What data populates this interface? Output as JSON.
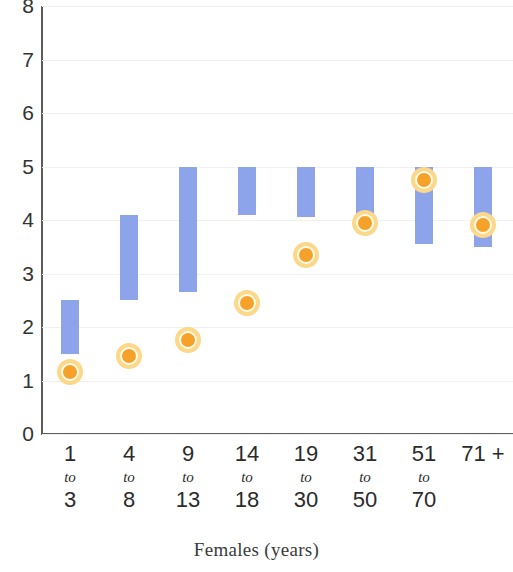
{
  "chart_data": {
    "type": "bar",
    "title": "",
    "subtitle": "",
    "xlabel": "Females (years)",
    "ylabel": "",
    "ylim": [
      0,
      8
    ],
    "y_ticks": [
      0,
      1,
      2,
      3,
      4,
      5,
      6,
      7,
      8
    ],
    "grid": true,
    "legend": "none",
    "categories": [
      "1 to 3",
      "4 to 8",
      "9 to 13",
      "14 to 18",
      "19 to 30",
      "31 to 50",
      "51 to 70",
      "71 +"
    ],
    "category_lines": [
      {
        "first": "1",
        "to": "to",
        "second": "3"
      },
      {
        "first": "4",
        "to": "to",
        "second": "8"
      },
      {
        "first": "9",
        "to": "to",
        "second": "13"
      },
      {
        "first": "14",
        "to": "to",
        "second": "18"
      },
      {
        "first": "19",
        "to": "to",
        "second": "30"
      },
      {
        "first": "31",
        "to": "to",
        "second": "50"
      },
      {
        "first": "51",
        "to": "to",
        "second": "70"
      },
      {
        "first": "71 +",
        "to": "",
        "second": ""
      }
    ],
    "series": [
      {
        "name": "range",
        "type": "range-bar",
        "low": [
          1.5,
          2.5,
          2.65,
          4.1,
          4.05,
          3.9,
          3.55,
          3.5
        ],
        "high": [
          2.5,
          4.1,
          5.0,
          5.0,
          5.0,
          5.0,
          5.0,
          5.0
        ]
      },
      {
        "name": "value",
        "type": "marker",
        "values": [
          1.15,
          1.45,
          1.75,
          2.45,
          3.35,
          3.95,
          4.75,
          3.9
        ]
      }
    ],
    "colors": {
      "bar": "#8da4ea",
      "marker_fill": "#f6a22a",
      "marker_ring": "#fbd88a",
      "axis": "#5c5c5c",
      "grid": "#f0f0f2",
      "text": "#2b2b2b"
    }
  },
  "axis": {
    "y_tick_labels": [
      "8",
      "7",
      "6",
      "5",
      "4",
      "3",
      "2",
      "1",
      "0"
    ],
    "x_title": "Females (years)"
  }
}
